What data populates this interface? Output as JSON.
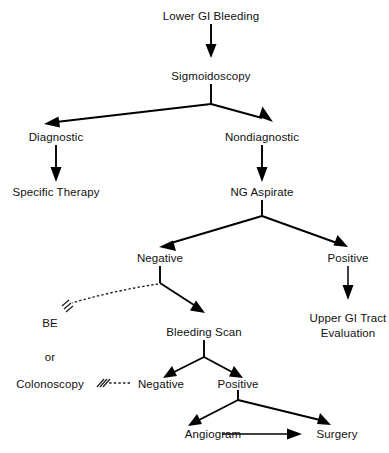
{
  "diagram": {
    "background_color": "#ffffff",
    "line_color": "#000000",
    "text_color": "#111111",
    "nodes": {
      "lower_gi_bleeding": "Lower GI Bleeding",
      "sigmoidoscopy": "Sigmoidoscopy",
      "diagnostic": "Diagnostic",
      "nondiagnostic": "Nondiagnostic",
      "specific_therapy": "Specific Therapy",
      "ng_aspirate": "NG Aspirate",
      "ng_negative": "Negative",
      "ng_positive": "Positive",
      "be": "BE",
      "or": "or",
      "colonoscopy": "Colonoscopy",
      "bleeding_scan": "Bleeding Scan",
      "upper_gi_tract_line1": "Upper GI Tract",
      "upper_gi_tract_line2": "Evaluation",
      "scan_negative": "Negative",
      "scan_positive": "Positive",
      "angiogram": "Angiogram",
      "surgery": "Surgery"
    },
    "edges": [
      {
        "from": "Lower GI Bleeding",
        "to": "Sigmoidoscopy",
        "style": "solid-arrow"
      },
      {
        "from": "Sigmoidoscopy",
        "to": "Diagnostic",
        "style": "solid-arrow"
      },
      {
        "from": "Sigmoidoscopy",
        "to": "Nondiagnostic",
        "style": "solid-arrow"
      },
      {
        "from": "Diagnostic",
        "to": "Specific Therapy",
        "style": "solid-arrow"
      },
      {
        "from": "Nondiagnostic",
        "to": "NG Aspirate",
        "style": "solid-arrow"
      },
      {
        "from": "NG Aspirate",
        "to": "Negative",
        "style": "solid-arrow"
      },
      {
        "from": "NG Aspirate",
        "to": "Positive",
        "style": "solid-arrow"
      },
      {
        "from": "Positive",
        "to": "Upper GI Tract Evaluation",
        "style": "solid-arrow"
      },
      {
        "from": "Negative",
        "to": "BE",
        "style": "dashed-arrow"
      },
      {
        "from": "Negative",
        "to": "Bleeding Scan",
        "style": "solid-arrow"
      },
      {
        "from": "Bleeding Scan",
        "to": "Negative",
        "style": "solid-arrow"
      },
      {
        "from": "Bleeding Scan",
        "to": "Positive",
        "style": "solid-arrow"
      },
      {
        "from": "Negative",
        "to": "Colonoscopy",
        "style": "dashed-arrow"
      },
      {
        "from": "Positive",
        "to": "Angiogram",
        "style": "solid-arrow"
      },
      {
        "from": "Positive",
        "to": "Surgery",
        "style": "solid-arrow"
      },
      {
        "from": "Angiogram",
        "to": "Surgery",
        "style": "solid-arrow"
      }
    ]
  }
}
